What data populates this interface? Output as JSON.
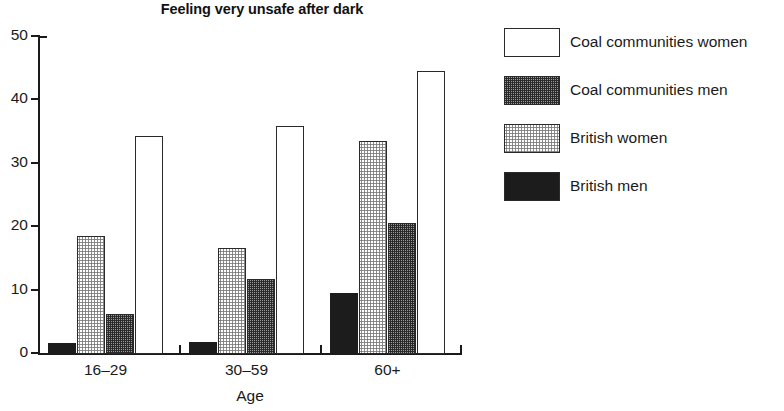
{
  "chart_data": {
    "type": "bar",
    "title": "Feeling very unsafe after dark",
    "xlabel": "Age",
    "ylabel": "",
    "categories": [
      "16–29",
      "30–59",
      "60+"
    ],
    "ylim": [
      0,
      50
    ],
    "yticks": [
      0,
      10,
      20,
      30,
      40,
      50
    ],
    "ytick_labels": [
      "0",
      "10",
      "20",
      "30",
      "40",
      "50"
    ],
    "grid": false,
    "legend_position": "right",
    "series": [
      {
        "name": "Coal communities women",
        "fill": "white",
        "color": "#ffffff",
        "values": [
          34.3,
          35.8,
          44.5
        ]
      },
      {
        "name": "Coal communities men",
        "fill": "dark-stipple",
        "color": "#9a9a9a",
        "values": [
          6.2,
          11.6,
          20.5
        ]
      },
      {
        "name": "British women",
        "fill": "light-stipple",
        "color": "#e0e0e0",
        "values": [
          18.5,
          16.5,
          33.4
        ]
      },
      {
        "name": "British men",
        "fill": "black",
        "color": "#1c1c1c",
        "values": [
          1.5,
          1.8,
          9.5
        ]
      }
    ],
    "bar_order_in_group": [
      "British men",
      "British women",
      "Coal communities men",
      "Coal communities women"
    ]
  },
  "legend": {
    "items": [
      {
        "label": "Coal communities women",
        "fill": "white"
      },
      {
        "label": "Coal communities men",
        "fill": "dark-stipple"
      },
      {
        "label": "British women",
        "fill": "light-stipple"
      },
      {
        "label": "British men",
        "fill": "black"
      }
    ]
  },
  "axes": {
    "y_tick_labels": [
      "50",
      "40",
      "30",
      "20",
      "10",
      "0"
    ],
    "x_tick_labels": [
      "16–29",
      "30–59",
      "60+"
    ],
    "x_title": "Age"
  }
}
